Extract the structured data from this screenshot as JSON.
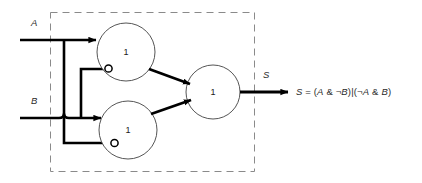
{
  "diagram": {
    "title_visible": false,
    "boundary": {
      "style": "dashed",
      "label": ""
    },
    "inputs": [
      {
        "id": "A",
        "label": "A"
      },
      {
        "id": "B",
        "label": "B"
      }
    ],
    "outputs": [
      {
        "id": "S",
        "label": "S"
      }
    ],
    "gates": [
      {
        "id": "or-top",
        "label": "1",
        "type": "or"
      },
      {
        "id": "or-bottom",
        "label": "1",
        "type": "or"
      },
      {
        "id": "or-output",
        "label": "1",
        "type": "or"
      }
    ],
    "inverters": [
      {
        "id": "bubble-top",
        "on_gate": "or-top",
        "negates": "B"
      },
      {
        "id": "bubble-bottom",
        "on_gate": "or-bottom",
        "negates": "A"
      }
    ],
    "formula": {
      "lhs": "S",
      "eq": " = ",
      "full": "S = (A & ¬B)|(¬A & B)",
      "parts": [
        {
          "t": "S",
          "italic": true
        },
        {
          "t": " = (",
          "italic": false
        },
        {
          "t": "A",
          "italic": true
        },
        {
          "t": " & ¬",
          "italic": false
        },
        {
          "t": "B",
          "italic": true
        },
        {
          "t": ")|(¬",
          "italic": false
        },
        {
          "t": "A",
          "italic": true
        },
        {
          "t": " & ",
          "italic": false
        },
        {
          "t": "B",
          "italic": true
        },
        {
          "t": ")",
          "italic": false
        }
      ]
    }
  },
  "colors": {
    "wire": "#000000",
    "gate_outline": "#555555",
    "boundary": "#8a8a8a",
    "text": "#2b2b2b",
    "background": "#ffffff"
  }
}
